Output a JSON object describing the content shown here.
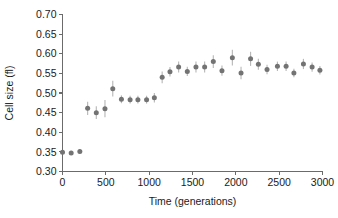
{
  "chart_data": {
    "type": "scatter",
    "title": "",
    "xlabel": "Time (generations)",
    "ylabel": "Cell size (fl)",
    "xlim": [
      0,
      3000
    ],
    "ylim": [
      0.3,
      0.7
    ],
    "xticks": [
      0,
      500,
      1000,
      1500,
      2000,
      2500,
      3000
    ],
    "xtick_labels": [
      "0",
      "500",
      "1000",
      "1500",
      "2000",
      "2500",
      "3000"
    ],
    "yticks": [
      0.3,
      0.35,
      0.4,
      0.45,
      0.5,
      0.55,
      0.6,
      0.65,
      0.7
    ],
    "ytick_labels": [
      "0.30",
      "0.35",
      "0.40",
      "0.45",
      "0.50",
      "0.55",
      "0.60",
      "0.65",
      "0.70"
    ],
    "grid": false,
    "legend": false,
    "marker_color": "#737373",
    "errorbar_color": "#b9b9b9",
    "axis_color": "#6b6b6b",
    "series": [
      {
        "name": "Cell size",
        "x": [
          0,
          100,
          200,
          290,
          390,
          490,
          580,
          680,
          780,
          870,
          970,
          1060,
          1150,
          1240,
          1340,
          1440,
          1540,
          1640,
          1740,
          1840,
          1960,
          2060,
          2170,
          2260,
          2360,
          2480,
          2580,
          2670,
          2780,
          2880,
          2970
        ],
        "y": [
          0.349,
          0.347,
          0.351,
          0.461,
          0.45,
          0.46,
          0.511,
          0.484,
          0.483,
          0.483,
          0.483,
          0.488,
          0.54,
          0.554,
          0.566,
          0.555,
          0.566,
          0.566,
          0.58,
          0.557,
          0.59,
          0.551,
          0.587,
          0.573,
          0.56,
          0.568,
          0.568,
          0.551,
          0.574,
          0.566,
          0.558
        ],
        "yerr": [
          0.004,
          0.005,
          0.006,
          0.017,
          0.016,
          0.022,
          0.02,
          0.01,
          0.01,
          0.01,
          0.01,
          0.012,
          0.015,
          0.012,
          0.014,
          0.012,
          0.014,
          0.014,
          0.016,
          0.013,
          0.02,
          0.016,
          0.018,
          0.014,
          0.012,
          0.012,
          0.012,
          0.011,
          0.013,
          0.012,
          0.011
        ]
      }
    ]
  }
}
